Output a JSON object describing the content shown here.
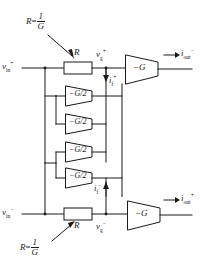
{
  "diagram": {
    "colors": {
      "line": "#1a1a1a",
      "text": "#1a1a1a",
      "background": "#ffffff"
    },
    "annotations": {
      "top_note": {
        "lhs": "R",
        "eq": "=",
        "num": "1",
        "den": "G"
      },
      "bottom_note": {
        "lhs": "R",
        "eq": "=",
        "num": "1",
        "den": "G"
      }
    },
    "labels": {
      "vin_plus": {
        "base": "v",
        "sub": "in",
        "sup": "+"
      },
      "vin_minus": {
        "base": "v",
        "sub": "in",
        "sup": "−"
      },
      "vg_plus": {
        "base": "v",
        "sub": "g",
        "sup": "+"
      },
      "vg_minus": {
        "base": "v",
        "sub": "g",
        "sup": "−"
      },
      "if_plus": {
        "base": "i",
        "sub": "f",
        "sup": "+"
      },
      "if_minus": {
        "base": "i",
        "sub": "f",
        "sup": "−"
      },
      "iout_minus": {
        "arrow": "→",
        "base": "i",
        "sub": "out",
        "sup": "−"
      },
      "iout_plus": {
        "arrow": "→",
        "base": "i",
        "sub": "out",
        "sup": "+"
      },
      "resistor_top": "R",
      "resistor_bottom": "R"
    },
    "amplifiers": [
      {
        "id": "amp-top-main",
        "label": "−G"
      },
      {
        "id": "amp-gby2-1",
        "label": "−G/2"
      },
      {
        "id": "amp-gby2-2",
        "label": "−G/2"
      },
      {
        "id": "amp-gby2-3",
        "label": "−G/2"
      },
      {
        "id": "amp-gby2-4",
        "label": "−G/2"
      },
      {
        "id": "amp-bottom-main",
        "label": "−G"
      }
    ]
  }
}
